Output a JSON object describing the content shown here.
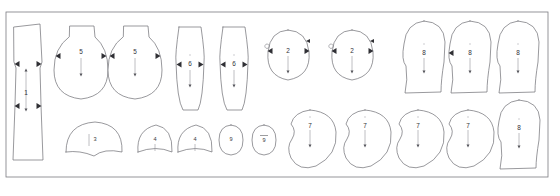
{
  "document": {
    "title": "Pattern Nesting Layout",
    "background_color": "#ffffff",
    "line_color": "#6d6d73",
    "label_color": "#303036",
    "frame": {
      "x": 6,
      "y": 12,
      "width": 542,
      "height": 165
    }
  },
  "legend": {
    "grain_marker_name": "grain-line-arrow",
    "notch_marker_name": "notch-triangle"
  },
  "pieces": [
    {
      "id": "p1",
      "label": "1",
      "shape": "long-tapered-panel",
      "row": "top",
      "label_x": 26,
      "label_y": 93,
      "grain": {
        "x": 26,
        "y1": 70,
        "y2": 110,
        "arrow": "both"
      },
      "notches": 4,
      "path": "M14,27 L40,24 L42,62 L40,68 L41,105 L43,160 L13,160 L15,105 L16,68 L14,62 Z"
    },
    {
      "id": "p2",
      "label": "5",
      "shape": "teardrop-bulb",
      "row": "top",
      "label_x": 81,
      "label_y": 52,
      "grain": {
        "x": 81,
        "y1": 58,
        "y2": 75,
        "arrow": "down"
      },
      "notches": 2,
      "path": "M70,26 L94,26 L95,37 Q108,48 108,70 Q108,96 81,99 Q54,96 54,70 Q54,48 69,37 Z"
    },
    {
      "id": "p3",
      "label": "5",
      "shape": "teardrop-bulb",
      "row": "top",
      "label_x": 135,
      "label_y": 52,
      "grain": {
        "x": 135,
        "y1": 58,
        "y2": 75,
        "arrow": "down"
      },
      "notches": 2,
      "path": "M124,26 L148,26 L149,37 Q162,48 162,70 Q162,96 135,99 Q108,96 108,70 Q108,48 123,37 Z"
    },
    {
      "id": "p4",
      "label": "6",
      "shape": "elongated-leaf",
      "row": "top",
      "label_x": 190,
      "label_y": 64,
      "grain": {
        "x": 190,
        "y1": 70,
        "y2": 86,
        "arrow": "down"
      },
      "notches": 2,
      "path": "M179,27 L201,27 Q205,55 204,62 Q203,100 198,110 L183,110 Q177,100 176,62 Q175,55 179,27 Z"
    },
    {
      "id": "p5",
      "label": "6",
      "shape": "elongated-leaf",
      "row": "top",
      "label_x": 234,
      "label_y": 64,
      "grain": {
        "x": 234,
        "y1": 70,
        "y2": 86,
        "arrow": "down"
      },
      "notches": 2,
      "path": "M223,27 L245,27 Q249,55 248,62 Q247,100 242,110 L227,110 Q221,100 220,62 Q219,55 223,27 Z"
    },
    {
      "id": "p6",
      "label": "2",
      "shape": "egg-oval",
      "row": "top",
      "label_x": 288,
      "label_y": 51,
      "grain": {
        "x": 288,
        "y1": 56,
        "y2": 72,
        "arrow": "down"
      },
      "notches": 2,
      "path": "M288,30 Q307,31 309,52 Q311,76 288,80 Q266,76 268,52 Q270,31 288,30 Z"
    },
    {
      "id": "p7",
      "label": "2",
      "shape": "egg-oval",
      "row": "top",
      "label_x": 352,
      "label_y": 51,
      "grain": {
        "x": 352,
        "y1": 56,
        "y2": 72,
        "arrow": "down"
      },
      "notches": 2,
      "path": "M352,30 Q371,31 373,52 Q375,76 352,80 Q330,76 332,52 Q334,31 352,30 Z"
    },
    {
      "id": "p8",
      "label": "8",
      "shape": "dome-waisted",
      "row": "top",
      "label_x": 424,
      "label_y": 53,
      "grain": {
        "x": 424,
        "y1": 58,
        "y2": 72,
        "arrow": "down"
      },
      "notches": 0,
      "path": "M424,21 Q444,22 445,42 L444,62 Q441,80 441,92 L405,93 Q408,80 406,66 Q401,60 404,44 Q406,23 424,21 Z"
    },
    {
      "id": "p9",
      "label": "8",
      "shape": "dome-waisted",
      "row": "top",
      "label_x": 470,
      "label_y": 53,
      "grain": {
        "x": 470,
        "y1": 58,
        "y2": 72,
        "arrow": "down"
      },
      "notches": 1,
      "path": "M470,21 Q490,22 491,42 L490,62 Q487,80 487,92 L451,93 Q454,80 452,66 Q447,60 450,44 Q452,23 470,21 Z"
    },
    {
      "id": "p10",
      "label": "8",
      "shape": "dome-waisted",
      "row": "top",
      "label_x": 518,
      "label_y": 53,
      "grain": {
        "x": 518,
        "y1": 58,
        "y2": 72,
        "arrow": "down"
      },
      "notches": 0,
      "path": "M518,21 Q538,22 539,42 L538,62 Q535,80 535,92 L499,93 Q502,80 500,66 Q495,60 498,44 Q500,23 518,21 Z"
    },
    {
      "id": "p11",
      "label": "3",
      "shape": "wide-dome",
      "row": "bottom",
      "label_x": 95,
      "label_y": 140,
      "grain": {
        "x": 89,
        "y1": 134,
        "y2": 146,
        "arrow": "none"
      },
      "notches": 0,
      "path": "M66,152 Q66,124 95,122 Q123,124 122,152 Q104,148 94,156 Q80,150 66,152 Z"
    },
    {
      "id": "p12",
      "label": "4",
      "shape": "small-dome",
      "row": "bottom",
      "label_x": 155,
      "label_y": 140,
      "grain": {
        "x": 155,
        "y1": 144,
        "y2": 151,
        "arrow": "none"
      },
      "notches": 0,
      "path": "M138,152 Q136,130 156,125 Q173,128 172,152 Q156,145 138,152 Z"
    },
    {
      "id": "p13",
      "label": "4",
      "shape": "small-dome",
      "row": "bottom",
      "label_x": 195,
      "label_y": 140,
      "grain": {
        "x": 195,
        "y1": 144,
        "y2": 151,
        "arrow": "none"
      },
      "notches": 0,
      "path": "M178,152 Q176,130 196,125 Q213,128 212,152 Q196,145 178,152 Z"
    },
    {
      "id": "p14",
      "label": "9",
      "shape": "small-oval",
      "row": "bottom",
      "label_x": 231,
      "label_y": 140,
      "grain": null,
      "notches": 0,
      "overbar": false,
      "path": "M231,125 Q243,126 243,140 Q243,154 231,155 Q219,154 219,140 Q219,126 231,125 Z"
    },
    {
      "id": "p15",
      "label": "9",
      "shape": "small-oval",
      "row": "bottom",
      "label_x": 264,
      "label_y": 141,
      "grain": null,
      "notches": 0,
      "overbar": true,
      "path": "M264,125 Q276,126 276,140 Q276,154 264,155 Q252,154 252,140 Q252,126 264,125 Z"
    },
    {
      "id": "p16",
      "label": "7",
      "shape": "kidney-bean",
      "row": "bottom",
      "label_x": 310,
      "label_y": 126,
      "grain": {
        "x": 310,
        "y1": 130,
        "y2": 146,
        "arrow": "down"
      },
      "notches": 0,
      "path": "M310,110 Q334,112 336,132 Q338,155 316,166 Q299,172 291,158 Q286,147 292,139 Q297,131 291,124 Q294,112 310,110 Z"
    },
    {
      "id": "p17",
      "label": "7",
      "shape": "kidney-bean",
      "row": "bottom",
      "label_x": 365,
      "label_y": 126,
      "grain": {
        "x": 365,
        "y1": 130,
        "y2": 146,
        "arrow": "down"
      },
      "notches": 0,
      "path": "M365,110 Q389,112 391,132 Q393,155 371,166 Q354,172 346,158 Q341,147 347,139 Q352,131 346,124 Q349,112 365,110 Z"
    },
    {
      "id": "p18",
      "label": "7",
      "shape": "kidney-bean",
      "row": "bottom",
      "label_x": 418,
      "label_y": 126,
      "grain": {
        "x": 418,
        "y1": 130,
        "y2": 146,
        "arrow": "down"
      },
      "notches": 0,
      "path": "M418,110 Q442,112 444,132 Q446,155 424,166 Q407,172 399,158 Q394,147 400,139 Q405,131 399,124 Q402,112 418,110 Z"
    },
    {
      "id": "p19",
      "label": "7",
      "shape": "kidney-bean",
      "row": "bottom",
      "label_x": 468,
      "label_y": 126,
      "grain": {
        "x": 468,
        "y1": 130,
        "y2": 146,
        "arrow": "down"
      },
      "notches": 0,
      "path": "M468,110 Q492,112 494,132 Q496,155 474,166 Q457,172 449,158 Q444,147 450,139 Q455,131 449,124 Q452,112 468,110 Z"
    },
    {
      "id": "p20",
      "label": "8",
      "shape": "dome-waisted",
      "row": "bottom",
      "label_x": 519,
      "label_y": 128,
      "grain": {
        "x": 519,
        "y1": 133,
        "y2": 147,
        "arrow": "down"
      },
      "notches": 0,
      "path": "M519,100 Q539,101 540,120 L539,140 Q536,158 536,168 L500,169 Q503,156 501,142 Q496,136 499,121 Q501,102 519,100 Z"
    }
  ]
}
